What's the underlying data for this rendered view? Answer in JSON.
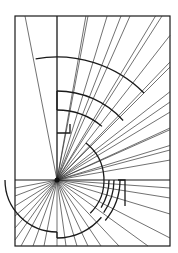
{
  "diagram": {
    "type": "radial line pattern with concentric arc segments",
    "colors": {
      "stroke": "#1a1a1a",
      "background": "#ffffff"
    },
    "frame": {
      "x": 15,
      "y": 16,
      "width": 155,
      "height": 230
    },
    "center": {
      "x": 57,
      "y": 180
    },
    "horizontal_line_y": 180,
    "vertical_line_x": 57,
    "upper_ray_endpoints": [
      [
        25,
        16
      ],
      [
        57,
        16
      ],
      [
        88,
        16
      ],
      [
        121,
        16
      ],
      [
        162,
        16
      ],
      [
        170,
        62
      ],
      [
        170,
        102
      ],
      [
        170,
        128
      ],
      [
        170,
        150
      ]
    ],
    "lower_ray_endpoints": [
      [
        15,
        188
      ],
      [
        15,
        196
      ],
      [
        15,
        206
      ],
      [
        15,
        216
      ],
      [
        15,
        228
      ],
      [
        15,
        240
      ],
      [
        21,
        246
      ],
      [
        33,
        246
      ],
      [
        44,
        246
      ],
      [
        57,
        246
      ],
      [
        66,
        246
      ],
      [
        77,
        246
      ],
      [
        88,
        246
      ],
      [
        101,
        246
      ],
      [
        119,
        246
      ],
      [
        148,
        246
      ],
      [
        170,
        238
      ],
      [
        170,
        214
      ],
      [
        170,
        198
      ],
      [
        170,
        188
      ]
    ],
    "upper_left_fan_rays": [
      [
        62,
        16
      ],
      [
        66,
        16
      ],
      [
        72,
        16
      ],
      [
        77,
        16
      ],
      [
        82,
        16
      ]
    ],
    "arcs": [
      {
        "name": "outer-upper-arc",
        "radius": 123,
        "from_deg": 100,
        "to_deg": 45
      },
      {
        "name": "middle-upper-arc",
        "radius": 89,
        "from_deg": 90,
        "to_deg": 42
      },
      {
        "name": "inner-upper-arc",
        "radius": 70,
        "from_deg": 90,
        "to_deg": 50
      },
      {
        "name": "right-arc",
        "radius": 47,
        "from_deg": 52,
        "to_deg": -45
      },
      {
        "name": "lower-left-arc",
        "radius": 52,
        "from_deg": 180,
        "to_deg": 270
      },
      {
        "name": "lower-right-arc",
        "radius": 58,
        "from_deg": -90,
        "to_deg": -40
      },
      {
        "name": "small-arc-1",
        "radius": 52,
        "from_deg": 0,
        "to_deg": -32
      },
      {
        "name": "small-arc-2",
        "radius": 57,
        "from_deg": 0,
        "to_deg": -35
      },
      {
        "name": "small-arc-3",
        "radius": 63,
        "from_deg": 0,
        "to_deg": -40
      }
    ]
  }
}
